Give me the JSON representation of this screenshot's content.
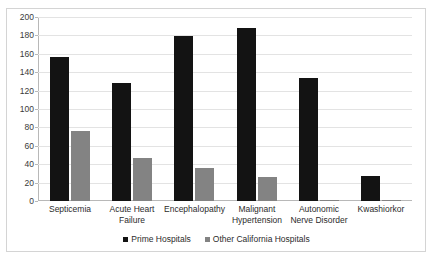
{
  "chart_data": {
    "type": "bar",
    "title": "",
    "xlabel": "",
    "ylabel": "",
    "ylim": [
      0,
      200
    ],
    "ytick_step": 20,
    "yticks": [
      0,
      20,
      40,
      60,
      80,
      100,
      120,
      140,
      160,
      180,
      200
    ],
    "grid": true,
    "legend_position": "bottom",
    "categories": [
      "Septicemia",
      "Acute Heart Failure",
      "Encephalopathy",
      "Malignant Hypertension",
      "Autonomic Nerve Disorder",
      "Kwashiorkor"
    ],
    "series": [
      {
        "name": "Prime Hospitals",
        "color": "#131313",
        "values": [
          156,
          128,
          179,
          188,
          134,
          27
        ]
      },
      {
        "name": "Other California Hospitals",
        "color": "#838383",
        "values": [
          76,
          47,
          36,
          26,
          1,
          1
        ]
      }
    ]
  },
  "legend": {
    "items": [
      {
        "label": "Prime Hospitals",
        "swatch": "prime-swatch"
      },
      {
        "label": "Other California Hospitals",
        "swatch": "other-swatch"
      }
    ]
  },
  "axis": {
    "y_tick_labels": [
      "200",
      "180",
      "160",
      "140",
      "120",
      "100",
      "80",
      "60",
      "40",
      "20",
      "0"
    ]
  },
  "category_labels": [
    "Septicemia",
    "Acute Heart Failure",
    "Encephalopathy",
    "Malignant Hypertension",
    "Autonomic Nerve Disorder",
    "Kwashiorkor"
  ]
}
